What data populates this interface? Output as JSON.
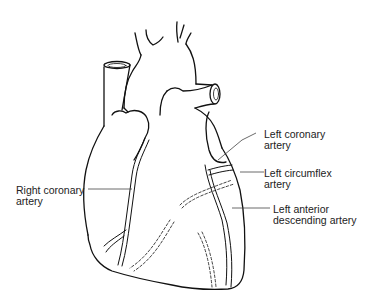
{
  "diagram": {
    "colors": {
      "line": "#111111",
      "leader": "#444444",
      "background": "#ffffff",
      "text": "#222222"
    },
    "labels": [
      {
        "id": "left-coronary-artery",
        "line1": "Left coronary",
        "line2": "artery"
      },
      {
        "id": "left-circumflex-artery",
        "line1": "Left circumflex",
        "line2": "artery"
      },
      {
        "id": "right-coronary-artery",
        "line1": "Right coronary",
        "line2": "artery"
      },
      {
        "id": "left-anterior-descending-artery",
        "line1": "Left anterior",
        "line2": "descending artery"
      }
    ]
  }
}
